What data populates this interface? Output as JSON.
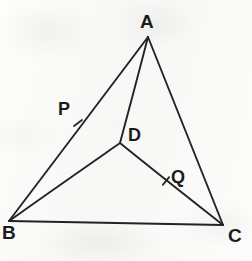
{
  "figure": {
    "kind": "geometry-diagram",
    "medium": "pencil sketch on paper",
    "width": 252,
    "height": 261,
    "background_color": "#fbfbfa",
    "ink_color": "#1b1b1b"
  },
  "points": [
    {
      "id": "A",
      "label": "A",
      "role": "apex-vertex",
      "x": 148,
      "y": 37,
      "label_x": 140,
      "label_y": 12,
      "font_size": 19
    },
    {
      "id": "B",
      "label": "B",
      "role": "bottom-left-vertex",
      "x": 9,
      "y": 221,
      "label_x": 2,
      "label_y": 223,
      "font_size": 19
    },
    {
      "id": "C",
      "label": "C",
      "role": "bottom-right-vertex",
      "x": 223,
      "y": 225,
      "label_x": 228,
      "label_y": 226,
      "font_size": 19
    },
    {
      "id": "D",
      "label": "D",
      "role": "interior-point",
      "x": 120,
      "y": 143,
      "label_x": 128,
      "label_y": 126,
      "font_size": 18
    },
    {
      "id": "P",
      "label": "P",
      "role": "tick-label-on-AB",
      "x": 78,
      "y": 123,
      "label_x": 58,
      "label_y": 100,
      "font_size": 18
    },
    {
      "id": "Q",
      "label": "Q",
      "role": "tick-label-on-DC",
      "x": 166,
      "y": 181,
      "label_x": 171,
      "label_y": 168,
      "font_size": 18
    }
  ],
  "segments": [
    {
      "id": "AB",
      "from": "A",
      "to": "B",
      "name": "side-ab",
      "x1": 148,
      "y1": 37,
      "x2": 9,
      "y2": 221
    },
    {
      "id": "AC",
      "from": "A",
      "to": "C",
      "name": "side-ac",
      "x1": 148,
      "y1": 37,
      "x2": 223,
      "y2": 225
    },
    {
      "id": "BC",
      "from": "B",
      "to": "C",
      "name": "side-bc",
      "x1": 9,
      "y1": 221,
      "x2": 223,
      "y2": 225
    },
    {
      "id": "AD",
      "from": "A",
      "to": "D",
      "name": "cevian-ad",
      "x1": 148,
      "y1": 37,
      "x2": 120,
      "y2": 143
    },
    {
      "id": "BD",
      "from": "B",
      "to": "D",
      "name": "cevian-bd",
      "x1": 9,
      "y1": 221,
      "x2": 120,
      "y2": 143
    },
    {
      "id": "DC",
      "from": "D",
      "to": "C",
      "name": "cevian-dc",
      "x1": 120,
      "y1": 143,
      "x2": 223,
      "y2": 225
    }
  ],
  "tick_marks": [
    {
      "id": "tick-P",
      "on_segment": "AB",
      "label": "P",
      "x": 78,
      "y": 123,
      "angle_deg": 53
    },
    {
      "id": "tick-Q",
      "on_segment": "DC",
      "label": "Q",
      "x": 166,
      "y": 181,
      "angle_deg": 39
    }
  ]
}
